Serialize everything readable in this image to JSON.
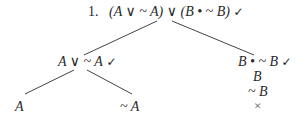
{
  "tree": {
    "root": {
      "number": "1.",
      "formula": "(A ∨ ~ A) ∨ (B • ~ B)",
      "checked": true,
      "check_mark": "✓"
    },
    "left_branch": {
      "formula": "A ∨ ~ A",
      "checked": true,
      "check_mark": "✓",
      "children": [
        {
          "formula": "A"
        },
        {
          "formula": "~ A"
        }
      ]
    },
    "right_branch": {
      "formula": "B • ~ B",
      "checked": true,
      "check_mark": "✓",
      "stack": [
        {
          "formula": "B"
        },
        {
          "formula": "~ B"
        }
      ],
      "closed_mark": "×"
    }
  },
  "colors": {
    "text": "#2a2a2a",
    "lines": "#444444",
    "background": "#ffffff"
  }
}
